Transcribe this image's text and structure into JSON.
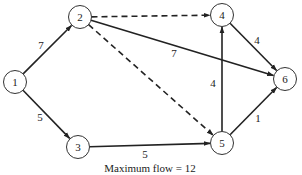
{
  "diagram": {
    "type": "network-flow",
    "nodes": [
      {
        "id": "1",
        "label": "1",
        "x": 15,
        "y": 82
      },
      {
        "id": "2",
        "label": "2",
        "x": 80,
        "y": 17
      },
      {
        "id": "3",
        "label": "3",
        "x": 78,
        "y": 147
      },
      {
        "id": "4",
        "label": "4",
        "x": 222,
        "y": 15
      },
      {
        "id": "5",
        "label": "5",
        "x": 222,
        "y": 143
      },
      {
        "id": "6",
        "label": "6",
        "x": 285,
        "y": 79
      }
    ],
    "edges": [
      {
        "from": "1",
        "to": "2",
        "flow": "7",
        "style": "solid",
        "label_x": 41,
        "label_y": 45
      },
      {
        "from": "1",
        "to": "3",
        "flow": "5",
        "style": "solid",
        "label_x": 40,
        "label_y": 117
      },
      {
        "from": "2",
        "to": "4",
        "flow": "",
        "style": "dashed"
      },
      {
        "from": "2",
        "to": "6",
        "flow": "7",
        "style": "solid",
        "label_x": 174,
        "label_y": 53
      },
      {
        "from": "2",
        "to": "5",
        "flow": "",
        "style": "dashed"
      },
      {
        "from": "3",
        "to": "5",
        "flow": "5",
        "style": "solid",
        "label_x": 145,
        "label_y": 154
      },
      {
        "from": "5",
        "to": "4",
        "flow": "4",
        "style": "solid",
        "label_x": 213,
        "label_y": 83
      },
      {
        "from": "4",
        "to": "6",
        "flow": "4",
        "style": "solid",
        "label_x": 257,
        "label_y": 40
      },
      {
        "from": "5",
        "to": "6",
        "flow": "1",
        "style": "solid",
        "label_x": 258,
        "label_y": 118
      }
    ],
    "caption": "Maximum flow = 12",
    "node_radius": 11.5
  }
}
